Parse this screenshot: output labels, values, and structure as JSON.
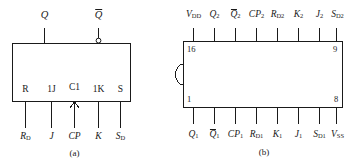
{
  "figure": {
    "type": "logic-symbol-and-pinout-diagram",
    "line_color": "#1a1a1a",
    "background": "#ffffff"
  },
  "left_diagram": {
    "caption": "(a)",
    "description": "JK flip-flop logic symbol",
    "outputs": [
      {
        "label": "Q",
        "overbar": false,
        "bubble": false
      },
      {
        "label": "Q",
        "overbar": true,
        "bubble": true
      }
    ],
    "internal_pins": [
      {
        "label": "R"
      },
      {
        "label": "1J"
      },
      {
        "label": "C1"
      },
      {
        "label": "1K"
      },
      {
        "label": "S"
      }
    ],
    "external_pins": [
      {
        "base": "R",
        "sub": "D",
        "italic": true
      },
      {
        "base": "J",
        "sub": "",
        "italic": true
      },
      {
        "base": "CP",
        "sub": "",
        "italic": true
      },
      {
        "base": "K",
        "sub": "",
        "italic": true
      },
      {
        "base": "S",
        "sub": "D",
        "italic": true
      }
    ]
  },
  "right_diagram": {
    "caption": "(b)",
    "description": "16-pin DIP package pin assignment",
    "corner_pin_numbers": {
      "top_left": "16",
      "top_right": "9",
      "bottom_left": "1",
      "bottom_right": "8"
    },
    "top_pins": [
      {
        "base": "V",
        "sub": "DD",
        "overbar": false
      },
      {
        "base": "Q",
        "sub": "2",
        "overbar": false
      },
      {
        "base": "Q",
        "sub": "2",
        "overbar": true
      },
      {
        "base": "CP",
        "sub": "2",
        "overbar": false
      },
      {
        "base": "R",
        "sub": "D2",
        "overbar": false
      },
      {
        "base": "K",
        "sub": "2",
        "overbar": false
      },
      {
        "base": "J",
        "sub": "2",
        "overbar": false
      },
      {
        "base": "S",
        "sub": "D2",
        "overbar": false
      }
    ],
    "bottom_pins": [
      {
        "base": "Q",
        "sub": "1",
        "overbar": false
      },
      {
        "base": "Q",
        "sub": "1",
        "overbar": true
      },
      {
        "base": "CP",
        "sub": "1",
        "overbar": false
      },
      {
        "base": "R",
        "sub": "D1",
        "overbar": false
      },
      {
        "base": "K",
        "sub": "1",
        "overbar": false
      },
      {
        "base": "J",
        "sub": "1",
        "overbar": false
      },
      {
        "base": "S",
        "sub": "D1",
        "overbar": false
      },
      {
        "base": "V",
        "sub": "SS",
        "overbar": false
      }
    ]
  }
}
